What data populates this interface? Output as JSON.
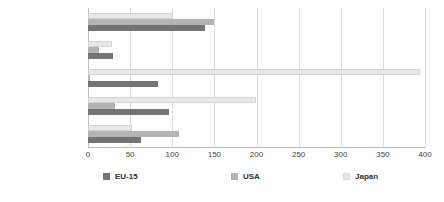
{
  "chart_data": {
    "type": "bar",
    "orientation": "horizontal",
    "title": "",
    "subtitle": "",
    "xlabel": "",
    "ylabel": "",
    "xlim": [
      0,
      400
    ],
    "xticks": [
      0,
      50,
      100,
      150,
      200,
      250,
      300,
      350,
      400
    ],
    "xtick_labels": [
      "0",
      "50",
      "100",
      "150",
      "200",
      "250",
      "300",
      "350",
      "400"
    ],
    "grid": true,
    "grid_axis": "x",
    "legend_position": "bottom",
    "categories": [
      "Passenger cars (2)",
      "Buses & coaches",
      "Railways",
      "Trams & metros (3)",
      "Air (4)"
    ],
    "series": [
      {
        "name": "EU-15",
        "color": "#757575",
        "values": [
          139,
          30,
          83,
          96,
          63
        ]
      },
      {
        "name": "USA",
        "color": "#b4b4b4",
        "values": [
          150,
          13,
          2,
          32,
          108
        ]
      },
      {
        "name": "Japan",
        "color": "#e8e8e8",
        "values": [
          101,
          28,
          394,
          199,
          52
        ]
      }
    ],
    "series_draw_order_top_to_bottom": [
      "Japan",
      "USA",
      "EU-15"
    ]
  },
  "legend": {
    "items": [
      {
        "label": "EU-15",
        "swatch": "legend-swatch-eu15"
      },
      {
        "label": "USA",
        "swatch": "legend-swatch-usa"
      },
      {
        "label": "Japan",
        "swatch": "legend-swatch-japan"
      }
    ]
  }
}
